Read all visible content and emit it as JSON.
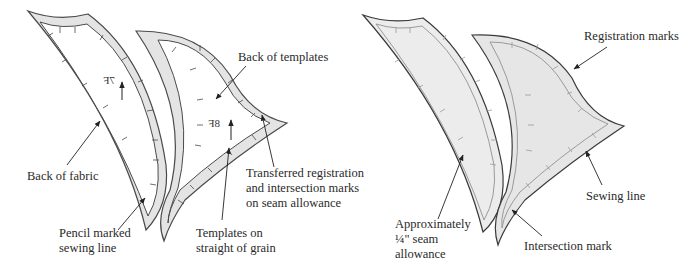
{
  "figure": {
    "left_panel": {
      "name": "Back of fabric with templates",
      "templates": [
        {
          "id": "7F",
          "mirrored_label": "7F",
          "grain_arrow": "up"
        },
        {
          "id": "8F",
          "mirrored_label": "8F",
          "grain_arrow": "up"
        }
      ],
      "labels": {
        "back_of_templates": [
          "Back of templates"
        ],
        "back_of_fabric": [
          "Back of fabric"
        ],
        "pencil_line": [
          "Pencil marked",
          "sewing line"
        ],
        "transferred_marks": [
          "Transferred registration",
          "and intersection marks",
          "on seam allowance"
        ],
        "straight_grain": [
          "Templates on",
          "straight of grain"
        ]
      }
    },
    "right_panel": {
      "name": "Cut fabric pieces",
      "labels": {
        "registration_marks": [
          "Registration marks"
        ],
        "sewing_line": [
          "Sewing line"
        ],
        "seam_allowance": [
          "Approximately",
          "¼\" seam",
          "allowance"
        ],
        "intersection_mark": [
          "Intersection mark"
        ]
      }
    },
    "colors": {
      "outline": "#4a4a4a",
      "seam_band": "#e4e4e4",
      "piece_fill": "#ececec",
      "text": "#2a2a2a",
      "background": "#ffffff"
    }
  }
}
